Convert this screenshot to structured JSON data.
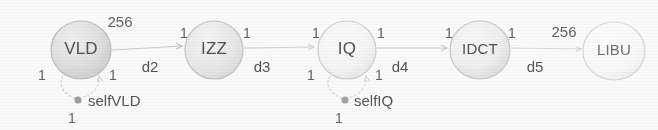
{
  "diagram": {
    "type": "dataflow-graph",
    "title": "",
    "background_color": "#fdfdfd",
    "node_stroke_color": "#b9b9b9",
    "edge_color": "#c2c2c2",
    "text_color": "#4b4b4b",
    "nodes": [
      {
        "id": "vld",
        "label": "VLD",
        "cx": 81,
        "cy": 50,
        "rx": 30,
        "ry": 29,
        "fill": "#e2e2e2"
      },
      {
        "id": "izz",
        "label": "IZZ",
        "cx": 214,
        "cy": 50,
        "rx": 29,
        "ry": 29,
        "fill": "#ececec"
      },
      {
        "id": "iq",
        "label": "IQ",
        "cx": 347,
        "cy": 50,
        "rx": 29,
        "ry": 29,
        "fill": "#f7f7f7"
      },
      {
        "id": "idct",
        "label": "IDCT",
        "cx": 480,
        "cy": 50,
        "rx": 30,
        "ry": 29,
        "fill": "#f0f0f0"
      },
      {
        "id": "libu",
        "label": "LIBU",
        "cx": 614,
        "cy": 51,
        "rx": 31,
        "ry": 29,
        "fill": "#fbfbfb"
      }
    ],
    "edges": [
      {
        "id": "d2",
        "name": "d2",
        "from": "vld",
        "to": "izz",
        "source_weight": "256",
        "target_weight": "1",
        "name_x": 150,
        "name_y": 68,
        "source_weight_x": 120,
        "source_weight_y": 23,
        "target_weight_x": 184,
        "target_weight_y": 34
      },
      {
        "id": "d3",
        "name": "d3",
        "from": "izz",
        "to": "iq",
        "source_weight": "1",
        "target_weight": "1",
        "name_x": 262,
        "name_y": 68,
        "source_weight_x": 247,
        "source_weight_y": 34,
        "target_weight_x": 316,
        "target_weight_y": 34
      },
      {
        "id": "d4",
        "name": "d4",
        "from": "iq",
        "to": "idct",
        "source_weight": "1",
        "target_weight": "1",
        "name_x": 400,
        "name_y": 68,
        "source_weight_x": 381,
        "source_weight_y": 34,
        "target_weight_x": 449,
        "target_weight_y": 34
      },
      {
        "id": "d5",
        "name": "d5",
        "from": "idct",
        "to": "libu",
        "source_weight": "1",
        "target_weight": "256",
        "name_x": 535,
        "name_y": 68,
        "source_weight_x": 512,
        "source_weight_y": 34,
        "target_weight_x": 564,
        "target_weight_y": 33
      }
    ],
    "self_loops": [
      {
        "id": "selfvld",
        "name": "selfVLD",
        "node": "vld",
        "dot_x": 78,
        "dot_y": 100,
        "dot_r": 3.5,
        "name_x": 88,
        "name_y": 102,
        "left_weight": "1",
        "right_weight": "1",
        "bottom_weight": "1",
        "left_weight_x": 42,
        "left_weight_y": 76,
        "right_weight_x": 113,
        "right_weight_y": 76,
        "bottom_weight_x": 72,
        "bottom_weight_y": 119
      },
      {
        "id": "selfiq",
        "name": "selfIQ",
        "node": "iq",
        "dot_x": 345,
        "dot_y": 100,
        "dot_r": 3.5,
        "name_x": 354,
        "name_y": 102,
        "left_weight": "1",
        "right_weight": "1",
        "bottom_weight": "1",
        "left_weight_x": 311,
        "left_weight_y": 76,
        "right_weight_x": 379,
        "right_weight_y": 76,
        "bottom_weight_x": 339,
        "bottom_weight_y": 119
      }
    ]
  }
}
